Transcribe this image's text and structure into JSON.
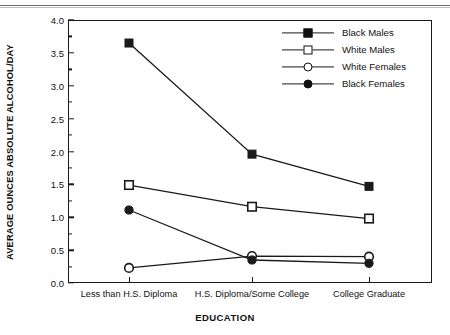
{
  "chart_data": {
    "type": "line",
    "title": "",
    "xlabel": "EDUCATION",
    "ylabel": "AVERAGE OUNCES ABSOLUTE ALCOHOL/DAY",
    "categories": [
      "Less than H.S. Diploma",
      "H.S. Diploma/Some College",
      "College Graduate"
    ],
    "ylim": [
      0.0,
      4.0
    ],
    "ytick_labels": [
      "0.0",
      "0.5",
      "1.0",
      "1.5",
      "2.0",
      "2.5",
      "3.0",
      "3.5",
      "4.0"
    ],
    "ytick_values": [
      0.0,
      0.5,
      1.0,
      1.5,
      2.0,
      2.5,
      3.0,
      3.5,
      4.0
    ],
    "minor_ticks": true,
    "grid": false,
    "legend_position": "top-right",
    "series": [
      {
        "name": "Black Males",
        "marker": "filled-square",
        "values": [
          3.65,
          1.96,
          1.47
        ]
      },
      {
        "name": "White Males",
        "marker": "open-square",
        "values": [
          1.49,
          1.16,
          0.98
        ]
      },
      {
        "name": "White Females",
        "marker": "open-circle",
        "values": [
          0.23,
          0.41,
          0.4
        ]
      },
      {
        "name": "Black Females",
        "marker": "filled-circle",
        "values": [
          1.11,
          0.35,
          0.3
        ]
      }
    ]
  },
  "axis": {
    "y_title": "AVERAGE OUNCES ABSOLUTE ALCOHOL/DAY",
    "x_title": "EDUCATION"
  },
  "legend": {
    "entries": [
      {
        "label": "Black Males"
      },
      {
        "label": "White Males"
      },
      {
        "label": "White Females"
      },
      {
        "label": "Black Females"
      }
    ]
  },
  "colors": {
    "ink": "#1a1a1a",
    "background": "#ffffff"
  }
}
